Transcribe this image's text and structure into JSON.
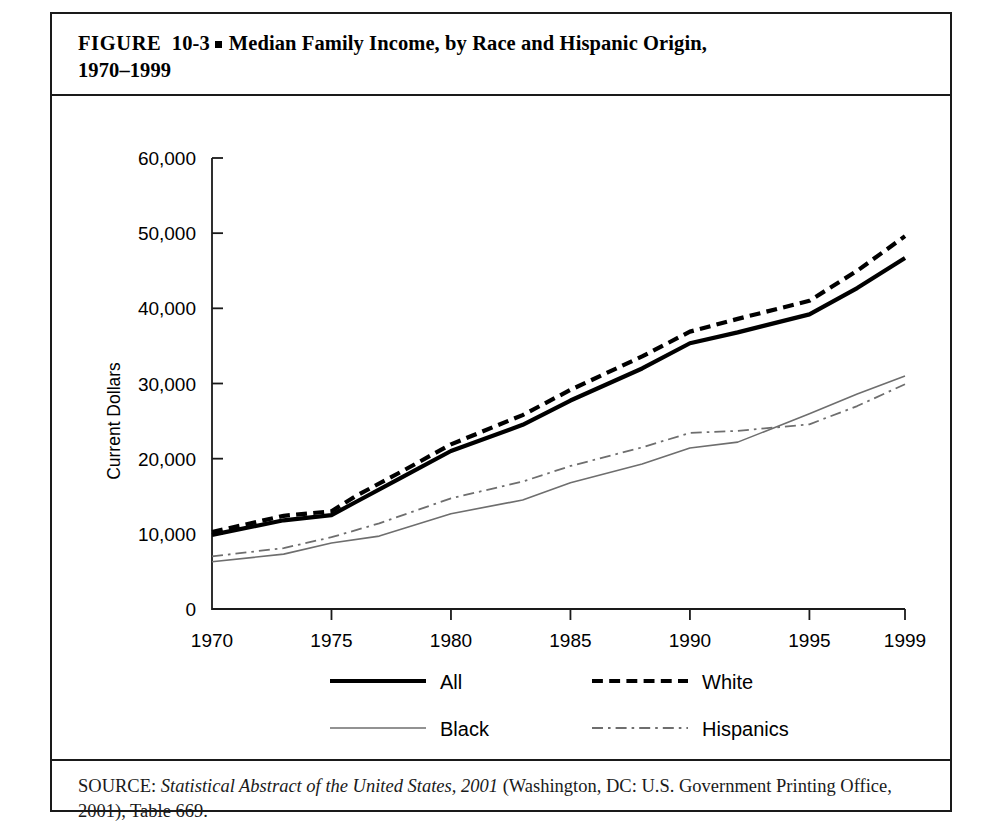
{
  "figure": {
    "label": "FIGURE",
    "number": "10-3",
    "bullet_icon": "square-bullet",
    "title_line1": "Median Family Income, by Race and Hispanic Origin,",
    "title_line2": "1970–1999"
  },
  "source": {
    "prefix": "SOURCE:",
    "italic_part": "Statistical Abstract of the United States, 2001",
    "rest": " (Washington, DC: U.S. Government Printing Office, 2001), Table 669."
  },
  "chart_data": {
    "type": "line",
    "title": "Median Family Income, by Race and Hispanic Origin, 1970–1999",
    "xlabel": "",
    "ylabel": "Current Dollars",
    "xlim": [
      1970,
      1999
    ],
    "ylim": [
      0,
      60000
    ],
    "grid": false,
    "legend_position": "bottom",
    "xticks": [
      "1970",
      "1975",
      "1980",
      "1985",
      "1990",
      "1995",
      "1999"
    ],
    "xtick_values": [
      1970,
      1975,
      1980,
      1985,
      1990,
      1995,
      1999
    ],
    "yticks": [
      "0",
      "10,000",
      "20,000",
      "30,000",
      "40,000",
      "50,000",
      "60,000"
    ],
    "ytick_values": [
      0,
      10000,
      20000,
      30000,
      40000,
      50000,
      60000
    ],
    "x": [
      1970,
      1975,
      1980,
      1985,
      1990,
      1995,
      1999
    ],
    "series": [
      {
        "name": "All",
        "style": "solid",
        "width": 4.2,
        "color": "#000000",
        "values": [
          9867,
          12500,
          21023,
          27735,
          35353,
          39200,
          46700
        ]
      },
      {
        "name": "White",
        "style": "dashed",
        "width": 4.2,
        "color": "#000000",
        "values": [
          10236,
          13000,
          21900,
          29150,
          36900,
          41000,
          49600
        ]
      },
      {
        "name": "Black",
        "style": "solid",
        "width": 1.6,
        "color": "#6e6e6e",
        "values": [
          6279,
          8779,
          12674,
          16786,
          21423,
          25970,
          31000
        ]
      },
      {
        "name": "Hispanics",
        "style": "dashdot",
        "width": 1.8,
        "color": "#6e6e6e",
        "values": [
          7000,
          9550,
          14716,
          19027,
          23431,
          24570,
          29900
        ]
      }
    ],
    "dense_points": {
      "All": [
        [
          1970,
          9867
        ],
        [
          1973,
          11800
        ],
        [
          1975,
          12500
        ],
        [
          1976,
          14200
        ],
        [
          1978,
          17600
        ],
        [
          1980,
          21023
        ],
        [
          1983,
          24500
        ],
        [
          1985,
          27735
        ],
        [
          1988,
          32000
        ],
        [
          1990,
          35353
        ],
        [
          1992,
          36800
        ],
        [
          1995,
          39200
        ],
        [
          1997,
          42700
        ],
        [
          1999,
          46700
        ]
      ],
      "White": [
        [
          1970,
          10236
        ],
        [
          1973,
          12400
        ],
        [
          1975,
          13000
        ],
        [
          1976,
          15000
        ],
        [
          1978,
          18400
        ],
        [
          1980,
          21900
        ],
        [
          1983,
          25800
        ],
        [
          1985,
          29150
        ],
        [
          1988,
          33600
        ],
        [
          1990,
          36900
        ],
        [
          1992,
          38600
        ],
        [
          1995,
          41000
        ],
        [
          1997,
          45000
        ],
        [
          1999,
          49600
        ]
      ],
      "Black": [
        [
          1970,
          6279
        ],
        [
          1973,
          7300
        ],
        [
          1975,
          8779
        ],
        [
          1977,
          9700
        ],
        [
          1980,
          12674
        ],
        [
          1983,
          14500
        ],
        [
          1985,
          16786
        ],
        [
          1988,
          19300
        ],
        [
          1990,
          21423
        ],
        [
          1992,
          22200
        ],
        [
          1995,
          25970
        ],
        [
          1997,
          28600
        ],
        [
          1999,
          31000
        ]
      ],
      "Hispanics": [
        [
          1970,
          7000
        ],
        [
          1973,
          8100
        ],
        [
          1975,
          9550
        ],
        [
          1977,
          11400
        ],
        [
          1980,
          14716
        ],
        [
          1983,
          16950
        ],
        [
          1985,
          19027
        ],
        [
          1988,
          21500
        ],
        [
          1990,
          23431
        ],
        [
          1992,
          23700
        ],
        [
          1995,
          24570
        ],
        [
          1997,
          27000
        ],
        [
          1999,
          29900
        ]
      ]
    }
  },
  "legend": {
    "items": [
      {
        "label": "All",
        "style": "solid",
        "width": 4.2,
        "color": "#000000"
      },
      {
        "label": "White",
        "style": "dashed",
        "width": 4.2,
        "color": "#000000"
      },
      {
        "label": "Black",
        "style": "solid",
        "width": 1.6,
        "color": "#6e6e6e"
      },
      {
        "label": "Hispanics",
        "style": "dashdot",
        "width": 1.8,
        "color": "#6e6e6e"
      }
    ]
  }
}
